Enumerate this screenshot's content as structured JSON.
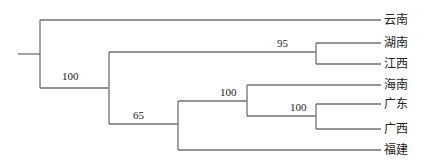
{
  "diagram": {
    "type": "phylogenetic-tree",
    "line_color": "#707070",
    "taxa": [
      {
        "id": "yunnan",
        "label": "云南",
        "y": 20
      },
      {
        "id": "hunan",
        "label": "湖南",
        "y": 43
      },
      {
        "id": "jiangxi",
        "label": "江西",
        "y": 64
      },
      {
        "id": "hainan",
        "label": "海南",
        "y": 85
      },
      {
        "id": "guangdong",
        "label": "广东",
        "y": 104
      },
      {
        "id": "guangxi",
        "label": "广西",
        "y": 129
      },
      {
        "id": "fujian",
        "label": "福建",
        "y": 150
      }
    ],
    "support_values": {
      "root_lower_clade": "100",
      "hunan_jiangxi": "95",
      "lower_clade": "65",
      "hainan_guangdong_guangxi": "100",
      "guangdong_guangxi": "100"
    }
  }
}
